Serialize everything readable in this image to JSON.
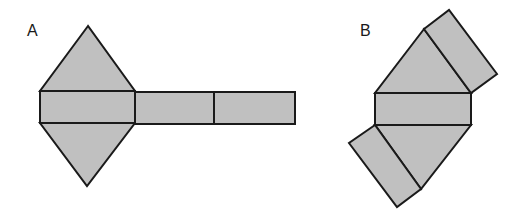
{
  "figures": [
    {
      "label": "A",
      "label_pos": {
        "x": 27,
        "y": 23
      },
      "description": "Net of a triangular prism: two triangles attached to the top and bottom of the first of three rectangles in a row",
      "faces": [
        {
          "type": "triangle",
          "points": "88,26 40,91 135,91"
        },
        {
          "type": "rectangle",
          "points": "40,91 135,91 135,123 40,123"
        },
        {
          "type": "triangle",
          "points": "40,123 135,123 87,186"
        },
        {
          "type": "rectangle",
          "points": "135,92 214,92 214,124 135,124"
        },
        {
          "type": "rectangle",
          "points": "214,92 295,92 295,124 214,124"
        }
      ]
    },
    {
      "label": "B",
      "label_pos": {
        "x": 360,
        "y": 23
      },
      "description": "Net of a triangular prism: central rectangle with triangles above and below, and rectangles attached to the slanted sides of each triangle",
      "faces": [
        {
          "type": "triangle",
          "points": "424,29 375,93 471,93"
        },
        {
          "type": "rectangle",
          "points": "424,29 449,10 497,74 471,93"
        },
        {
          "type": "rectangle",
          "points": "375,93 471,93 471,125 375,125"
        },
        {
          "type": "triangle",
          "points": "375,125 471,125 421,189"
        },
        {
          "type": "rectangle",
          "points": "375,125 349,143 397,207 421,189"
        }
      ]
    }
  ],
  "colors": {
    "face_fill": "#c0c0c0",
    "stroke": "#1a1a1a",
    "background": "#ffffff"
  }
}
